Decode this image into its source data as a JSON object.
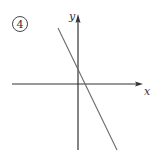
{
  "figure": {
    "label": "4",
    "x_axis_label": "x",
    "y_axis_label": "y",
    "colors": {
      "axis": "#333333",
      "line": "#6a6a6a",
      "label": "#333333",
      "background": "#ffffff"
    },
    "geometry": {
      "origin": {
        "x": 78,
        "y": 84
      },
      "x_axis": {
        "x1": 12,
        "x2": 143,
        "y": 84
      },
      "y_axis": {
        "x": 78,
        "y1": 150,
        "y2": 14
      },
      "line": {
        "x1": 58,
        "y1": 28,
        "x2": 117,
        "y2": 150
      },
      "y_intercept_px": {
        "x": 78,
        "y": 68
      },
      "x_intercept_px": {
        "x": 85,
        "y": 84
      }
    }
  }
}
